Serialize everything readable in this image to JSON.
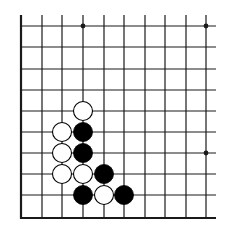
{
  "diagram": {
    "type": "go-board-fragment",
    "colors": {
      "background": "#ffffff",
      "line": "#1a1a1a",
      "black_stone": "#000000",
      "white_stone": "#ffffff"
    },
    "grid": {
      "x_lines": [
        21,
        42,
        62,
        83,
        104,
        124,
        145,
        165,
        186,
        206
      ],
      "y_lines": [
        26,
        47,
        69,
        90,
        111,
        132,
        153,
        174,
        195,
        218
      ],
      "line_right_end": 216,
      "line_top_start": 15,
      "thick_edges": [
        "left",
        "bottom"
      ]
    },
    "star_points": [
      {
        "col": 3,
        "row": 0
      },
      {
        "col": 9,
        "row": 0
      },
      {
        "col": 9,
        "row": 6
      }
    ],
    "stones": [
      {
        "color": "white",
        "col": 3,
        "row": 4
      },
      {
        "color": "white",
        "col": 2,
        "row": 5
      },
      {
        "color": "black",
        "col": 3,
        "row": 5
      },
      {
        "color": "white",
        "col": 2,
        "row": 6
      },
      {
        "color": "black",
        "col": 3,
        "row": 6
      },
      {
        "color": "white",
        "col": 2,
        "row": 7
      },
      {
        "color": "white",
        "col": 3,
        "row": 7
      },
      {
        "color": "black",
        "col": 4,
        "row": 7
      },
      {
        "color": "black",
        "col": 3,
        "row": 8
      },
      {
        "color": "white",
        "col": 4,
        "row": 8
      },
      {
        "color": "black",
        "col": 5,
        "row": 8
      }
    ],
    "stone_radius": 9.5
  }
}
